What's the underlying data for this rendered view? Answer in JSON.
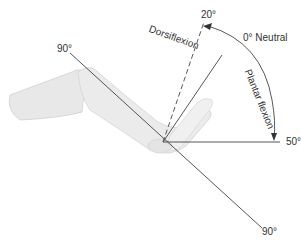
{
  "diagram": {
    "labels": {
      "upper_90": "90°",
      "lower_90": "90°",
      "dorsi_20": "20°",
      "neutral": "0° Neutral",
      "plantar_50": "50°",
      "dorsiflexion": "Dorsiflexion",
      "plantar_flexion": "Plantar flexion"
    },
    "angles": {
      "neutral_deg": 0,
      "dorsiflexion_deg": 20,
      "plantar_flexion_deg": 50,
      "leg_axis_deg": 90
    },
    "colors": {
      "line": "#333333",
      "leg_fill": "#ebebeb",
      "leg_shade": "#d6d6d6",
      "text": "#333333"
    }
  }
}
